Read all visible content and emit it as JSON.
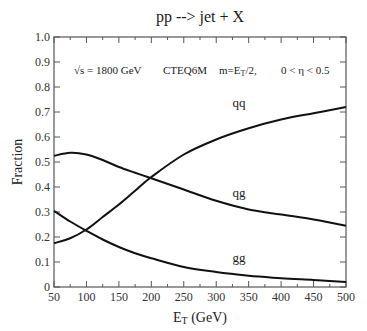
{
  "chart_data": {
    "type": "line",
    "title": "pp --> jet + X",
    "annotation": {
      "sqrt_s": "√s = 1800 GeV",
      "pdf": "CTEQ6M",
      "scale_main": "m=E",
      "scale_sub": "T",
      "scale_tail": "/2,",
      "eta_range": "0 < η < 0.5"
    },
    "xlabel_main": "E",
    "xlabel_sub": "T",
    "xlabel_tail": " (GeV)",
    "ylabel": "Fraction",
    "xlim": [
      50,
      500
    ],
    "ylim": [
      0,
      1.0
    ],
    "x_ticks": [
      50,
      100,
      150,
      200,
      250,
      300,
      350,
      400,
      450,
      500
    ],
    "x_tick_labels": [
      "50",
      "100",
      "150",
      "200",
      "250",
      "300",
      "350",
      "400",
      "450",
      "500"
    ],
    "x_minor_step": 25,
    "y_ticks": [
      0,
      0.1,
      0.2,
      0.3,
      0.4,
      0.5,
      0.6,
      0.7,
      0.8,
      0.9,
      1.0
    ],
    "y_tick_labels": [
      "0",
      "0.1",
      "0.2",
      "0.3",
      "0.4",
      "0.5",
      "0.6",
      "0.7",
      "0.8",
      "0.9",
      "1.0"
    ],
    "grid": false,
    "legend": "none",
    "series": [
      {
        "name": "qq",
        "label_at": [
          335,
          0.72
        ],
        "x": [
          50,
          75,
          100,
          125,
          150,
          175,
          200,
          250,
          300,
          350,
          400,
          450,
          500
        ],
        "values": [
          0.175,
          0.195,
          0.23,
          0.28,
          0.33,
          0.385,
          0.44,
          0.53,
          0.59,
          0.635,
          0.67,
          0.695,
          0.72
        ]
      },
      {
        "name": "qg",
        "label_at": [
          335,
          0.36
        ],
        "x": [
          50,
          75,
          100,
          125,
          150,
          175,
          200,
          250,
          300,
          350,
          400,
          450,
          500
        ],
        "values": [
          0.525,
          0.537,
          0.53,
          0.508,
          0.48,
          0.457,
          0.435,
          0.39,
          0.345,
          0.31,
          0.29,
          0.27,
          0.245
        ]
      },
      {
        "name": "gg",
        "label_at": [
          335,
          0.1
        ],
        "x": [
          50,
          75,
          100,
          125,
          150,
          175,
          200,
          250,
          300,
          350,
          400,
          450,
          500
        ],
        "values": [
          0.305,
          0.262,
          0.225,
          0.19,
          0.16,
          0.135,
          0.115,
          0.08,
          0.06,
          0.045,
          0.035,
          0.028,
          0.02
        ]
      }
    ]
  }
}
